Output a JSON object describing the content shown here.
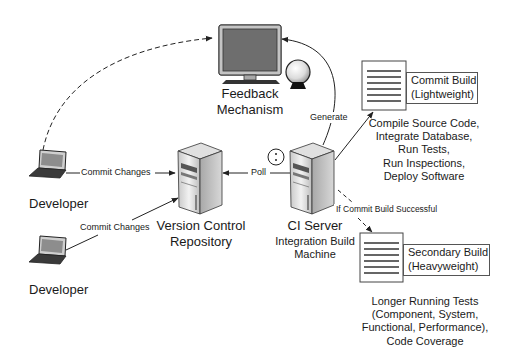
{
  "diagram": {
    "type": "continuous-integration-architecture",
    "nodes": {
      "feedback": {
        "label_line1": "Feedback",
        "label_line2": "Mechanism"
      },
      "developer_top": {
        "label": "Developer"
      },
      "developer_bottom": {
        "label": "Developer"
      },
      "repository": {
        "label_line1": "Version Control",
        "label_line2": "Repository"
      },
      "ci_server": {
        "label": "CI Server",
        "sub_line1": "Integration Build",
        "sub_line2": "Machine"
      },
      "commit_build": {
        "title_line1": "Commit Build",
        "title_line2": "(Lightweight)",
        "tasks": [
          "Compile Source Code,",
          "Integrate Database,",
          "Run Tests,",
          "Run Inspections,",
          "Deploy Software"
        ]
      },
      "secondary_build": {
        "title_line1": "Secondary Build",
        "title_line2": "(Heavyweight)",
        "tasks": [
          "Longer Running Tests",
          "(Component, System,",
          "Functional, Performance),",
          "Code Coverage"
        ]
      }
    },
    "edges": {
      "commit_top": "Commit Changes",
      "commit_bottom": "Commit Changes",
      "poll": "Poll",
      "generate": "Generate",
      "if_success": "If Commit Build Successful"
    },
    "colors": {
      "line": "#222222",
      "screen": "#6e6e6e",
      "frame": "#bdbdbd",
      "server_light": "#e6e6e6",
      "server_dark": "#9a9a9a",
      "text": "#1a1a1a"
    }
  }
}
